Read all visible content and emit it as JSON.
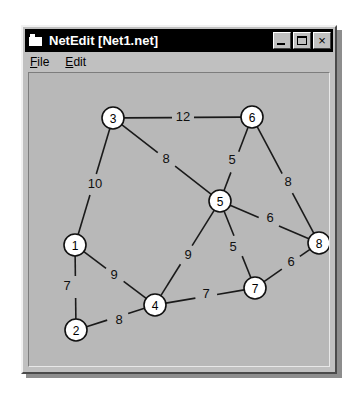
{
  "window": {
    "title": "NetEdit [Net1.net]",
    "app_name": "NetEdit",
    "document_name": "Net1.net",
    "icon": "app-icon",
    "titlebar_bg": "#000000",
    "titlebar_fg": "#ffffff",
    "face_color": "#c0c0c0",
    "canvas_color": "#b8b8b8"
  },
  "title_buttons": [
    {
      "name": "minimize",
      "label": "_",
      "glyph": "minimize-icon"
    },
    {
      "name": "maximize",
      "label": "□",
      "glyph": "maximize-icon"
    },
    {
      "name": "close",
      "label": "×",
      "glyph": "close-icon"
    }
  ],
  "menu": {
    "items": [
      {
        "label": "File",
        "mnemonic": "F",
        "rest": "ile"
      },
      {
        "label": "Edit",
        "mnemonic": "E",
        "rest": "dit"
      }
    ]
  },
  "chart_data": {
    "type": "diagram",
    "subtype": "weighted-undirected-graph",
    "title": "Net1.net",
    "node_radius": 11,
    "node_fill": "#ffffff",
    "node_stroke": "#111111",
    "edge_stroke": "#1a1a1a",
    "viewbox": {
      "width": 304,
      "height": 296
    },
    "nodes": [
      {
        "id": "1",
        "label": "1",
        "x": 46,
        "y": 172
      },
      {
        "id": "2",
        "label": "2",
        "x": 47,
        "y": 257
      },
      {
        "id": "3",
        "label": "3",
        "x": 84,
        "y": 45
      },
      {
        "id": "4",
        "label": "4",
        "x": 126,
        "y": 232
      },
      {
        "id": "5",
        "label": "5",
        "x": 191,
        "y": 128
      },
      {
        "id": "6",
        "label": "6",
        "x": 223,
        "y": 44
      },
      {
        "id": "7",
        "label": "7",
        "x": 226,
        "y": 215
      },
      {
        "id": "8",
        "label": "8",
        "x": 290,
        "y": 170
      }
    ],
    "edges": [
      {
        "source": "3",
        "target": "6",
        "weight": 12,
        "label_x": 154,
        "label_y": 45
      },
      {
        "source": "3",
        "target": "5",
        "weight": 8,
        "label_x": 137,
        "label_y": 87
      },
      {
        "source": "3",
        "target": "1",
        "weight": 10,
        "label_x": 66,
        "label_y": 112
      },
      {
        "source": "6",
        "target": "5",
        "weight": 5,
        "label_x": 203,
        "label_y": 88
      },
      {
        "source": "6",
        "target": "8",
        "weight": 8,
        "label_x": 259,
        "label_y": 110
      },
      {
        "source": "5",
        "target": "8",
        "weight": 6,
        "label_x": 241,
        "label_y": 146
      },
      {
        "source": "5",
        "target": "7",
        "weight": 5,
        "label_x": 204,
        "label_y": 175
      },
      {
        "source": "5",
        "target": "4",
        "weight": 9,
        "label_x": 159,
        "label_y": 183
      },
      {
        "source": "7",
        "target": "8",
        "weight": 6,
        "label_x": 262,
        "label_y": 190
      },
      {
        "source": "7",
        "target": "4",
        "weight": 7,
        "label_x": 177,
        "label_y": 222
      },
      {
        "source": "1",
        "target": "4",
        "weight": 9,
        "label_x": 85,
        "label_y": 203
      },
      {
        "source": "1",
        "target": "2",
        "weight": 7,
        "label_x": 38,
        "label_y": 214
      },
      {
        "source": "2",
        "target": "4",
        "weight": 8,
        "label_x": 90,
        "label_y": 248
      }
    ]
  }
}
